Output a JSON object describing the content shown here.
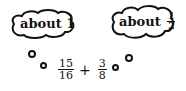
{
  "thoughts": [
    {
      "label": "about",
      "value": "1",
      "value_type": "whole"
    },
    {
      "label": "about",
      "value_numerator": "1",
      "value_denominator": "2",
      "value_type": "fraction"
    }
  ],
  "expression": {
    "term1": {
      "numerator": "15",
      "denominator": "16"
    },
    "operator": "+",
    "term2": {
      "numerator": "3",
      "denominator": "8"
    }
  }
}
